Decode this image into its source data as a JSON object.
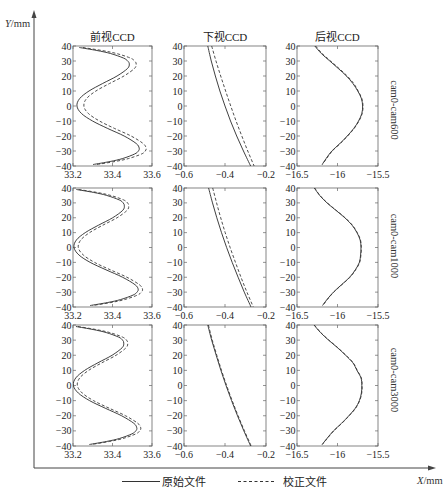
{
  "axes": {
    "y": {
      "var": "Y",
      "unit": "/mm"
    },
    "x": {
      "var": "X",
      "unit": "/mm"
    }
  },
  "columns": [
    {
      "title": "前视CCD"
    },
    {
      "title": "下视CCD"
    },
    {
      "title": "后视CCD"
    }
  ],
  "rows": [
    {
      "label": "cam0-cam600"
    },
    {
      "label": "cam0-cam1000"
    },
    {
      "label": "cam0-cam3000"
    }
  ],
  "legend": [
    {
      "label": "原始文件",
      "style": "solid"
    },
    {
      "label": "校正文件",
      "style": "dashed"
    }
  ],
  "chart_data": [
    {
      "type": "line",
      "row": 0,
      "col": 0,
      "title": "前视CCD",
      "row_label": "cam0-cam600",
      "xlim": [
        33.2,
        33.6
      ],
      "ylim": [
        -40,
        40
      ],
      "xticks": [
        33.2,
        33.4,
        33.6
      ],
      "xtick_labels": [
        "33.2",
        "33.4",
        "33.6"
      ],
      "yticks": [
        40,
        30,
        20,
        10,
        0,
        -10,
        -20,
        -30,
        -40
      ],
      "ytick_labels": [
        "40",
        "30",
        "20",
        "10",
        "0",
        "−10",
        "−20",
        "−30",
        "−40"
      ],
      "series": [
        {
          "name": "原始文件",
          "style": "solid",
          "y": [
            39,
            37,
            35,
            32,
            30,
            28,
            25,
            20,
            15,
            10,
            5,
            0,
            -5,
            -10,
            -15,
            -20,
            -25,
            -28,
            -30,
            -32,
            -35,
            -37,
            -39
          ],
          "x": [
            33.232,
            33.321,
            33.39,
            33.455,
            33.477,
            33.485,
            33.476,
            33.423,
            33.35,
            33.281,
            33.234,
            33.22,
            33.243,
            33.299,
            33.376,
            33.459,
            33.52,
            33.535,
            33.531,
            33.512,
            33.452,
            33.388,
            33.302
          ]
        },
        {
          "name": "校正文件",
          "style": "dashed",
          "y": [
            39,
            37,
            35,
            32,
            30,
            28,
            25,
            20,
            15,
            10,
            5,
            0,
            -5,
            -10,
            -15,
            -20,
            -25,
            -28,
            -30,
            -32,
            -35,
            -37,
            -39
          ],
          "x": [
            33.25,
            33.346,
            33.42,
            33.49,
            33.512,
            33.52,
            33.511,
            33.458,
            33.385,
            33.316,
            33.269,
            33.255,
            33.278,
            33.334,
            33.411,
            33.494,
            33.555,
            33.57,
            33.566,
            33.547,
            33.482,
            33.413,
            33.32
          ]
        }
      ]
    },
    {
      "type": "line",
      "row": 0,
      "col": 1,
      "title": "下视CCD",
      "row_label": "cam0-cam600",
      "xlim": [
        -0.6,
        -0.2
      ],
      "ylim": [
        -40,
        40
      ],
      "xticks": [
        -0.6,
        -0.4,
        -0.2
      ],
      "xtick_labels": [
        "−0.6",
        "−0.4",
        "−0.2"
      ],
      "yticks": [
        40,
        30,
        20,
        10,
        0,
        -10,
        -20,
        -30,
        -40
      ],
      "ytick_labels": [
        "40",
        "30",
        "20",
        "10",
        "0",
        "−10",
        "−20",
        "−30",
        "−40"
      ],
      "series": [
        {
          "name": "原始文件",
          "style": "solid",
          "y": [
            40,
            30,
            20,
            10,
            0,
            -10,
            -20,
            -30,
            -40
          ],
          "x": [
            -0.484,
            -0.467,
            -0.447,
            -0.425,
            -0.4,
            -0.373,
            -0.343,
            -0.31,
            -0.275
          ]
        },
        {
          "name": "校正文件",
          "style": "dashed",
          "y": [
            40,
            30,
            20,
            10,
            0,
            -10,
            -20,
            -30,
            -40
          ],
          "x": [
            -0.465,
            -0.444,
            -0.421,
            -0.397,
            -0.372,
            -0.346,
            -0.318,
            -0.289,
            -0.258
          ]
        }
      ]
    },
    {
      "type": "line",
      "row": 0,
      "col": 2,
      "title": "后视CCD",
      "row_label": "cam0-cam600",
      "xlim": [
        -16.5,
        -15.5
      ],
      "ylim": [
        -40,
        40
      ],
      "xticks": [
        -16.5,
        -16,
        -15.5
      ],
      "xtick_labels": [
        "−16.5",
        "−16",
        "−15.5"
      ],
      "yticks": [
        40,
        30,
        20,
        10,
        0,
        -10,
        -20,
        -30,
        -40
      ],
      "ytick_labels": [
        "40",
        "30",
        "20",
        "10",
        "0",
        "−10",
        "−20",
        "−30",
        "−40"
      ],
      "series": [
        {
          "name": "原始文件",
          "style": "solid",
          "y": [
            40,
            35,
            30,
            25,
            20,
            15,
            10,
            5,
            0,
            -5,
            -10,
            -15,
            -20,
            -25,
            -30,
            -35,
            -39
          ],
          "x": [
            -16.28,
            -16.2,
            -16.095,
            -15.99,
            -15.89,
            -15.81,
            -15.75,
            -15.705,
            -15.69,
            -15.7,
            -15.74,
            -15.8,
            -15.88,
            -15.97,
            -16.07,
            -16.14,
            -16.19
          ]
        },
        {
          "name": "校正文件",
          "style": "dashed",
          "y": [
            40,
            35,
            30,
            25,
            20,
            15,
            10,
            5,
            0,
            -5,
            -10,
            -15,
            -20,
            -25,
            -30,
            -35,
            -39
          ],
          "x": [
            -16.27,
            -16.19,
            -16.085,
            -15.98,
            -15.88,
            -15.8,
            -15.745,
            -15.7,
            -15.685,
            -15.695,
            -15.735,
            -15.795,
            -15.875,
            -15.965,
            -16.065,
            -16.135,
            -16.185
          ]
        }
      ]
    },
    {
      "type": "line",
      "row": 1,
      "col": 0,
      "title": "前视CCD",
      "row_label": "cam0-cam1000",
      "xlim": [
        33.2,
        33.6
      ],
      "ylim": [
        -40,
        40
      ],
      "xticks": [
        33.2,
        33.4,
        33.6
      ],
      "xtick_labels": [
        "33.2",
        "33.4",
        "33.6"
      ],
      "yticks": [
        40,
        30,
        20,
        10,
        0,
        -10,
        -20,
        -30,
        -40
      ],
      "ytick_labels": [
        "40",
        "30",
        "20",
        "10",
        "0",
        "−10",
        "−20",
        "−30",
        "−40"
      ],
      "series": [
        {
          "name": "原始文件",
          "style": "solid",
          "y": [
            39,
            37,
            35,
            32,
            30,
            28,
            25,
            20,
            15,
            10,
            5,
            0,
            -5,
            -10,
            -15,
            -20,
            -25,
            -28,
            -30,
            -32,
            -35,
            -37,
            -39
          ],
          "x": [
            33.217,
            33.305,
            33.371,
            33.434,
            33.454,
            33.46,
            33.452,
            33.401,
            33.329,
            33.262,
            33.217,
            33.205,
            33.23,
            33.287,
            33.367,
            33.451,
            33.514,
            33.53,
            33.524,
            33.504,
            33.441,
            33.375,
            33.287
          ]
        },
        {
          "name": "校正文件",
          "style": "dashed",
          "y": [
            39,
            37,
            35,
            32,
            30,
            28,
            25,
            20,
            15,
            10,
            5,
            0,
            -5,
            -10,
            -15,
            -20,
            -25,
            -28,
            -30,
            -32,
            -35,
            -37,
            -39
          ],
          "x": [
            33.229,
            33.322,
            33.391,
            33.456,
            33.476,
            33.482,
            33.474,
            33.423,
            33.351,
            33.284,
            33.239,
            33.227,
            33.252,
            33.309,
            33.389,
            33.473,
            33.536,
            33.552,
            33.546,
            33.526,
            33.461,
            33.392,
            33.299
          ]
        }
      ]
    },
    {
      "type": "line",
      "row": 1,
      "col": 1,
      "title": "下视CCD",
      "row_label": "cam0-cam1000",
      "xlim": [
        -0.6,
        -0.2
      ],
      "ylim": [
        -40,
        40
      ],
      "xticks": [
        -0.6,
        -0.4,
        -0.2
      ],
      "xtick_labels": [
        "−0.6",
        "−0.4",
        "−0.2"
      ],
      "yticks": [
        40,
        30,
        20,
        10,
        0,
        -10,
        -20,
        -30,
        -40
      ],
      "ytick_labels": [
        "40",
        "30",
        "20",
        "10",
        "0",
        "−10",
        "−20",
        "−30",
        "−40"
      ],
      "series": [
        {
          "name": "原始文件",
          "style": "solid",
          "y": [
            40,
            30,
            20,
            10,
            0,
            -10,
            -20,
            -30,
            -40
          ],
          "x": [
            -0.48,
            -0.461,
            -0.44,
            -0.417,
            -0.392,
            -0.365,
            -0.336,
            -0.306,
            -0.273
          ]
        },
        {
          "name": "校正文件",
          "style": "dashed",
          "y": [
            40,
            30,
            20,
            10,
            0,
            -10,
            -20,
            -30,
            -40
          ],
          "x": [
            -0.46,
            -0.441,
            -0.421,
            -0.399,
            -0.375,
            -0.349,
            -0.322,
            -0.293,
            -0.262
          ]
        }
      ]
    },
    {
      "type": "line",
      "row": 1,
      "col": 2,
      "title": "后视CCD",
      "row_label": "cam0-cam1000",
      "xlim": [
        -16.5,
        -15.5
      ],
      "ylim": [
        -40,
        40
      ],
      "xticks": [
        -16.5,
        -16,
        -15.5
      ],
      "xtick_labels": [
        "−16.5",
        "−16",
        "−15.5"
      ],
      "yticks": [
        40,
        30,
        20,
        10,
        0,
        -10,
        -20,
        -30,
        -40
      ],
      "ytick_labels": [
        "40",
        "30",
        "20",
        "10",
        "0",
        "−10",
        "−20",
        "−30",
        "−40"
      ],
      "series": [
        {
          "name": "原始文件",
          "style": "solid",
          "y": [
            40,
            35,
            30,
            25,
            20,
            15,
            10,
            5,
            0,
            -5,
            -10,
            -15,
            -20,
            -25,
            -30,
            -35,
            -39
          ],
          "x": [
            -16.286,
            -16.22,
            -16.13,
            -16.02,
            -15.91,
            -15.82,
            -15.76,
            -15.72,
            -15.71,
            -15.715,
            -15.73,
            -15.78,
            -15.85,
            -15.95,
            -16.05,
            -16.13,
            -16.185
          ]
        },
        {
          "name": "校正文件",
          "style": "dashed",
          "y": [
            40,
            35,
            30,
            25,
            20,
            15,
            10,
            5,
            0,
            -5,
            -10,
            -15,
            -20,
            -25,
            -30,
            -35,
            -39
          ],
          "x": [
            -16.282,
            -16.216,
            -16.126,
            -16.016,
            -15.906,
            -15.816,
            -15.756,
            -15.716,
            -15.706,
            -15.711,
            -15.726,
            -15.776,
            -15.846,
            -15.946,
            -16.046,
            -16.126,
            -16.181
          ]
        }
      ]
    },
    {
      "type": "line",
      "row": 2,
      "col": 0,
      "title": "前视CCD",
      "row_label": "cam0-cam3000",
      "xlim": [
        33.2,
        33.6
      ],
      "ylim": [
        -40,
        40
      ],
      "xticks": [
        33.2,
        33.4,
        33.6
      ],
      "xtick_labels": [
        "33.2",
        "33.4",
        "33.6"
      ],
      "yticks": [
        40,
        30,
        20,
        10,
        0,
        -10,
        -20,
        -30,
        -40
      ],
      "ytick_labels": [
        "40",
        "30",
        "20",
        "10",
        "0",
        "−10",
        "−20",
        "−30",
        "−40"
      ],
      "series": [
        {
          "name": "原始文件",
          "style": "solid",
          "y": [
            39,
            37,
            35,
            32,
            30,
            28,
            25,
            20,
            15,
            10,
            5,
            0,
            -5,
            -10,
            -15,
            -20,
            -25,
            -28,
            -30,
            -32,
            -35,
            -37,
            -39
          ],
          "x": [
            33.215,
            33.302,
            33.368,
            33.431,
            33.451,
            33.457,
            33.449,
            33.398,
            33.326,
            33.259,
            33.214,
            33.202,
            33.227,
            33.284,
            33.363,
            33.446,
            33.508,
            33.523,
            33.518,
            33.498,
            33.436,
            33.37,
            33.283
          ]
        },
        {
          "name": "校正文件",
          "style": "dashed",
          "y": [
            39,
            37,
            35,
            32,
            30,
            28,
            25,
            20,
            15,
            10,
            5,
            0,
            -5,
            -10,
            -15,
            -20,
            -25,
            -28,
            -30,
            -32,
            -35,
            -37,
            -39
          ],
          "x": [
            33.225,
            33.317,
            33.386,
            33.451,
            33.471,
            33.477,
            33.469,
            33.418,
            33.346,
            33.279,
            33.234,
            33.222,
            33.247,
            33.304,
            33.383,
            33.466,
            33.528,
            33.543,
            33.538,
            33.518,
            33.454,
            33.385,
            33.293
          ]
        }
      ]
    },
    {
      "type": "line",
      "row": 2,
      "col": 1,
      "title": "下视CCD",
      "row_label": "cam0-cam3000",
      "xlim": [
        -0.6,
        -0.2
      ],
      "ylim": [
        -40,
        40
      ],
      "xticks": [
        -0.6,
        -0.4,
        -0.2
      ],
      "xtick_labels": [
        "−0.6",
        "−0.4",
        "−0.2"
      ],
      "yticks": [
        40,
        30,
        20,
        10,
        0,
        -10,
        -20,
        -30,
        -40
      ],
      "ytick_labels": [
        "40",
        "30",
        "20",
        "10",
        "0",
        "−10",
        "−20",
        "−30",
        "−40"
      ],
      "series": [
        {
          "name": "原始文件",
          "style": "solid",
          "y": [
            40,
            30,
            20,
            10,
            0,
            -10,
            -20,
            -30,
            -40
          ],
          "x": [
            -0.484,
            -0.465,
            -0.443,
            -0.42,
            -0.395,
            -0.368,
            -0.339,
            -0.308,
            -0.275
          ]
        },
        {
          "name": "校正文件",
          "style": "dashed",
          "y": [
            40,
            30,
            20,
            10,
            0,
            -10,
            -20,
            -30,
            -40
          ],
          "x": [
            -0.481,
            -0.462,
            -0.44,
            -0.417,
            -0.392,
            -0.365,
            -0.336,
            -0.305,
            -0.272
          ]
        }
      ]
    },
    {
      "type": "line",
      "row": 2,
      "col": 2,
      "title": "后视CCD",
      "row_label": "cam0-cam3000",
      "xlim": [
        -16.5,
        -15.5
      ],
      "ylim": [
        -40,
        40
      ],
      "xticks": [
        -16.5,
        -16,
        -15.5
      ],
      "xtick_labels": [
        "−16.5",
        "−16",
        "−15.5"
      ],
      "yticks": [
        40,
        30,
        20,
        10,
        0,
        -10,
        -20,
        -30,
        -40
      ],
      "ytick_labels": [
        "40",
        "30",
        "20",
        "10",
        "0",
        "−10",
        "−20",
        "−30",
        "−40"
      ],
      "series": [
        {
          "name": "原始文件",
          "style": "solid",
          "y": [
            40,
            35,
            30,
            25,
            20,
            15,
            10,
            5,
            0,
            -5,
            -10,
            -15,
            -20,
            -25,
            -30,
            -35,
            -39
          ],
          "x": [
            -16.29,
            -16.21,
            -16.11,
            -16.0,
            -15.9,
            -15.81,
            -15.76,
            -15.71,
            -15.7,
            -15.705,
            -15.73,
            -15.78,
            -15.86,
            -15.95,
            -16.05,
            -16.13,
            -16.19
          ]
        },
        {
          "name": "校正文件",
          "style": "dashed",
          "y": [
            40,
            35,
            30,
            25,
            20,
            15,
            10,
            5,
            0,
            -5,
            -10,
            -15,
            -20,
            -25,
            -30,
            -35,
            -39
          ],
          "x": [
            -16.286,
            -16.206,
            -16.106,
            -15.996,
            -15.896,
            -15.806,
            -15.756,
            -15.706,
            -15.696,
            -15.701,
            -15.726,
            -15.776,
            -15.856,
            -15.946,
            -16.046,
            -16.126,
            -16.186
          ]
        }
      ]
    }
  ]
}
